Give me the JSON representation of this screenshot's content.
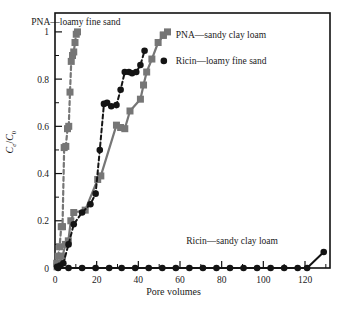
{
  "chart_data": {
    "type": "line",
    "title": "",
    "xlabel": "Pore volumes",
    "ylabel": "Ce/C0",
    "xlim": [
      0,
      132
    ],
    "ylim": [
      0,
      1.08
    ],
    "xticks": [
      0,
      20,
      40,
      60,
      80,
      100,
      120
    ],
    "xticklabels": [
      "0",
      "20",
      "40",
      "60",
      "80",
      "100",
      "120"
    ],
    "xminorticks": [
      10,
      30,
      50,
      70,
      90,
      110,
      130
    ],
    "yticks": [
      0,
      0.2,
      0.4,
      0.6,
      0.8,
      1
    ],
    "yticklabels": [
      "0",
      "0.2",
      "0.4",
      "0.6",
      "0.8",
      "1"
    ],
    "yminorticks": [
      0.1,
      0.3,
      0.5,
      0.7,
      0.9
    ],
    "grid": false,
    "legend_position": "inline-annotations",
    "series": [
      {
        "name": "PNA—loamy fine sand",
        "marker": "square",
        "color": "#767676",
        "linestyle": "dashed",
        "annotation": "PNA—loamy fine sand",
        "x": [
          0.8,
          1.5,
          2.2,
          3.0,
          3.6,
          4.4,
          5.2,
          6.0,
          6.6,
          7.2,
          7.8,
          8.4,
          9.0,
          9.6,
          10.2,
          10.8
        ],
        "y": [
          0.02,
          0.05,
          0.09,
          0.175,
          0.175,
          0.51,
          0.515,
          0.59,
          0.6,
          0.745,
          0.875,
          0.9,
          0.915,
          0.955,
          0.99,
          1.0
        ]
      },
      {
        "name": "PNA—sandy clay loam",
        "marker": "square",
        "color": "#767676",
        "linestyle": "solid",
        "annotation": "PNA—sandy clay loam",
        "x": [
          1.0,
          2.4,
          3.6,
          5.0,
          6.4,
          7.6,
          9.0,
          14.5,
          20.5,
          22.0,
          29.5,
          31.5,
          33.5,
          36.0,
          41.0,
          42.5,
          44.0,
          46.5,
          49.5,
          52.0,
          54.0
        ],
        "y": [
          0.005,
          0.02,
          0.05,
          0.1,
          0.115,
          0.2,
          0.235,
          0.245,
          0.375,
          0.39,
          0.605,
          0.595,
          0.59,
          0.665,
          0.715,
          0.775,
          0.83,
          0.885,
          0.955,
          0.985,
          1.0
        ]
      },
      {
        "name": "Ricin—loamy fine sand",
        "marker": "circle",
        "color": "#141414",
        "linestyle": "dashed",
        "annotation": "Ricin—loamy fine sand",
        "x": [
          1.0,
          2.5,
          4.0,
          6.5,
          9.0,
          13.0,
          17.0,
          19.5,
          21.5,
          23.5,
          25.0,
          27.0,
          29.5,
          31.5,
          33.5,
          35.5,
          37.0,
          39.0,
          41.0,
          43.0
        ],
        "y": [
          0.005,
          0.01,
          0.02,
          0.1,
          0.185,
          0.235,
          0.27,
          0.315,
          0.5,
          0.695,
          0.7,
          0.685,
          0.69,
          0.755,
          0.83,
          0.83,
          0.825,
          0.83,
          0.86,
          0.92
        ]
      },
      {
        "name": "Ricin—sandy clay loam",
        "marker": "circle",
        "color": "#141414",
        "linestyle": "solid",
        "annotation": "Ricin—sandy clay loam",
        "x": [
          1.5,
          6.5,
          13.0,
          19.5,
          26.0,
          32.0,
          38.5,
          45.0,
          51.5,
          58.0,
          64.5,
          71.0,
          77.5,
          84.0,
          90.5,
          97.0,
          103.5,
          110.0,
          116.5,
          121.0,
          129.0
        ],
        "y": [
          0.0,
          0.0,
          0.0,
          0.0,
          0.0,
          0.0,
          0.0,
          0.0,
          0.0,
          0.0,
          0.0,
          0.0,
          0.0,
          0.0,
          0.0,
          0.0,
          0.0,
          0.0,
          0.0,
          0.0,
          0.068
        ]
      }
    ],
    "annotations": [
      {
        "text": "PNA—loamy fine sand",
        "x": 10,
        "y": 1.04,
        "marker": "none"
      },
      {
        "text": "PNA—sandy clay loam",
        "x": 58,
        "y": 0.985,
        "marker": "square",
        "marker_color": "#767676"
      },
      {
        "text": "Ricin—loamy fine sand",
        "x": 58,
        "y": 0.875,
        "marker": "circle",
        "marker_color": "#141414"
      },
      {
        "text": "Ricin—sandy clay loam",
        "x": 85,
        "y": 0.115,
        "marker": "none"
      }
    ]
  },
  "figure": {
    "xlabel": "Pore volumes",
    "ylabel_num": "C",
    "ylabel_num_sub": "e",
    "ylabel_den": "C",
    "ylabel_den_sub": "0",
    "ylabel_slash": "/"
  }
}
